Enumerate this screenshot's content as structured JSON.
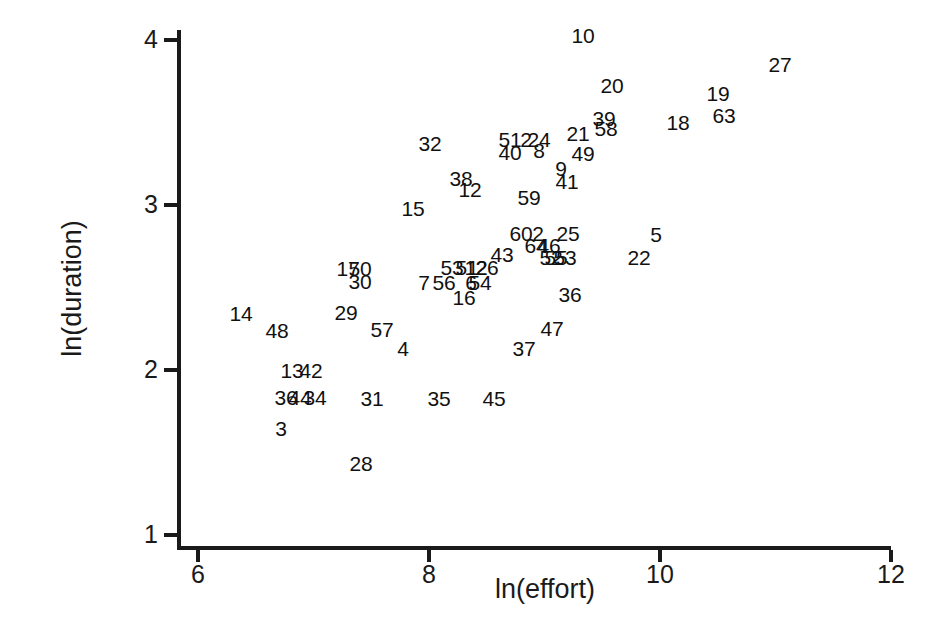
{
  "chart_data": {
    "type": "scatter",
    "title": "",
    "xlabel": "ln(effort)",
    "ylabel": "ln(duration)",
    "xlim": [
      6,
      12
    ],
    "ylim": [
      1,
      4
    ],
    "xticks": [
      6,
      8,
      10,
      12
    ],
    "yticks": [
      1,
      2,
      3,
      4
    ],
    "xtick_labels": [
      "6",
      "8",
      "10",
      "12"
    ],
    "ytick_labels": [
      "1",
      "2",
      "3",
      "4"
    ],
    "grid": false,
    "legend": null,
    "marker_style": "case-number-text",
    "points": [
      {
        "label": "10",
        "x": 9.34,
        "y": 3.98
      },
      {
        "label": "27",
        "x": 11.04,
        "y": 3.81
      },
      {
        "label": "20",
        "x": 9.59,
        "y": 3.68
      },
      {
        "label": "19",
        "x": 10.5,
        "y": 3.62
      },
      {
        "label": "18",
        "x": 10.15,
        "y": 3.44
      },
      {
        "label": "63",
        "x": 10.56,
        "y": 3.46
      },
      {
        "label": "39",
        "x": 9.48,
        "y": 3.49
      },
      {
        "label": "58",
        "x": 9.5,
        "y": 3.43
      },
      {
        "label": "21",
        "x": 9.26,
        "y": 3.4
      },
      {
        "label": "51",
        "x": 8.33,
        "y": 3.37
      },
      {
        "label": "2",
        "x": 8.47,
        "y": 3.37
      },
      {
        "label": "24",
        "x": 8.58,
        "y": 3.37
      },
      {
        "label": "40",
        "x": 8.33,
        "y": 3.29
      },
      {
        "label": "8",
        "x": 8.58,
        "y": 3.3
      },
      {
        "label": "49",
        "x": 9.3,
        "y": 3.29
      },
      {
        "label": "32",
        "x": 8.0,
        "y": 3.36
      },
      {
        "label": "9",
        "x": 9.1,
        "y": 3.2
      },
      {
        "label": "41",
        "x": 9.15,
        "y": 3.12
      },
      {
        "label": "38",
        "x": 8.44,
        "y": 3.14
      },
      {
        "label": "12",
        "x": 8.51,
        "y": 3.08
      },
      {
        "label": "59",
        "x": 9.02,
        "y": 3.03
      },
      {
        "label": "15",
        "x": 8.02,
        "y": 2.96
      },
      {
        "label": "60",
        "x": 8.93,
        "y": 2.79
      },
      {
        "label": "2b",
        "x": 9.05,
        "y": 2.79
      },
      {
        "label": "25",
        "x": 9.3,
        "y": 2.79
      },
      {
        "label": "5",
        "x": 9.97,
        "y": 2.76
      },
      {
        "label": "64",
        "x": 9.05,
        "y": 2.72
      },
      {
        "label": "46",
        "x": 9.16,
        "y": 2.72
      },
      {
        "label": "43",
        "x": 8.72,
        "y": 2.72
      },
      {
        "label": "52",
        "x": 9.21,
        "y": 2.65
      },
      {
        "label": "55",
        "x": 9.24,
        "y": 2.65
      },
      {
        "label": "53",
        "x": 9.33,
        "y": 2.65
      },
      {
        "label": "22",
        "x": 9.83,
        "y": 2.63
      },
      {
        "label": "17",
        "x": 7.44,
        "y": 2.64
      },
      {
        "label": "50",
        "x": 7.57,
        "y": 2.64
      },
      {
        "label": "30",
        "x": 7.57,
        "y": 2.57
      },
      {
        "label": "53b",
        "x": 8.56,
        "y": 2.65
      },
      {
        "label": "51b",
        "x": 8.67,
        "y": 2.65
      },
      {
        "label": "12b",
        "x": 8.73,
        "y": 2.65
      },
      {
        "label": "26",
        "x": 8.81,
        "y": 2.65
      },
      {
        "label": "7",
        "x": 8.29,
        "y": 2.57
      },
      {
        "label": "56",
        "x": 8.46,
        "y": 2.57
      },
      {
        "label": "6",
        "x": 8.66,
        "y": 2.57
      },
      {
        "label": "54",
        "x": 8.74,
        "y": 2.57
      },
      {
        "label": "16",
        "x": 8.61,
        "y": 2.48
      },
      {
        "label": "36",
        "x": 9.4,
        "y": 2.51
      },
      {
        "label": "14",
        "x": 6.55,
        "y": 2.41
      },
      {
        "label": "29",
        "x": 7.45,
        "y": 2.42
      },
      {
        "label": "48",
        "x": 6.85,
        "y": 2.31
      },
      {
        "label": "57",
        "x": 7.75,
        "y": 2.32
      },
      {
        "label": "47",
        "x": 9.24,
        "y": 2.32
      },
      {
        "label": "37",
        "x": 8.99,
        "y": 2.2
      },
      {
        "label": "4",
        "x": 7.94,
        "y": 2.2
      },
      {
        "label": "13",
        "x": 6.98,
        "y": 2.06
      },
      {
        "label": "42",
        "x": 7.1,
        "y": 2.06
      },
      {
        "label": "36b",
        "x": 7.03,
        "y": 1.89
      },
      {
        "label": "44",
        "x": 7.11,
        "y": 1.89
      },
      {
        "label": "34",
        "x": 7.19,
        "y": 1.89
      },
      {
        "label": "31",
        "x": 7.67,
        "y": 1.89
      },
      {
        "label": "35",
        "x": 8.25,
        "y": 1.89
      },
      {
        "label": "45",
        "x": 8.73,
        "y": 1.89
      },
      {
        "label": "3",
        "x": 6.9,
        "y": 1.71
      },
      {
        "label": "28",
        "x": 7.58,
        "y": 1.5
      }
    ]
  },
  "axes": {
    "y_title": "ln(duration)",
    "x_title": "ln(effort)",
    "y_ticks": [
      {
        "value": 4,
        "label": "4",
        "px": 38
      },
      {
        "value": 3,
        "label": "3",
        "px": 203
      },
      {
        "value": 2,
        "label": "2",
        "px": 368
      },
      {
        "value": 1,
        "label": "1",
        "px": 533
      }
    ],
    "x_ticks": [
      {
        "value": 6,
        "label": "6",
        "px": 197
      },
      {
        "value": 8,
        "label": "8",
        "px": 428
      },
      {
        "value": 10,
        "label": "10",
        "px": 659
      },
      {
        "value": 12,
        "label": "12",
        "px": 890
      }
    ]
  },
  "labels": [
    {
      "text": "10",
      "left": 583,
      "top": 35
    },
    {
      "text": "27",
      "left": 780,
      "top": 64
    },
    {
      "text": "20",
      "left": 612,
      "top": 85
    },
    {
      "text": "19",
      "left": 718,
      "top": 93
    },
    {
      "text": "63",
      "left": 724,
      "top": 115
    },
    {
      "text": "18",
      "left": 678,
      "top": 122
    },
    {
      "text": "39",
      "left": 604,
      "top": 118
    },
    {
      "text": "58",
      "left": 606,
      "top": 128
    },
    {
      "text": "21",
      "left": 578,
      "top": 133
    },
    {
      "text": "51",
      "left": 510,
      "top": 139
    },
    {
      "text": "2",
      "left": 526,
      "top": 139
    },
    {
      "text": "24",
      "left": 539,
      "top": 139
    },
    {
      "text": "40",
      "left": 510,
      "top": 152
    },
    {
      "text": "8",
      "left": 539,
      "top": 150
    },
    {
      "text": "49",
      "left": 583,
      "top": 153
    },
    {
      "text": "32",
      "left": 430,
      "top": 143
    },
    {
      "text": "9",
      "left": 561,
      "top": 168
    },
    {
      "text": "41",
      "left": 567,
      "top": 181
    },
    {
      "text": "38",
      "left": 461,
      "top": 178
    },
    {
      "text": "12",
      "left": 470,
      "top": 189
    },
    {
      "text": "59",
      "left": 529,
      "top": 197
    },
    {
      "text": "15",
      "left": 413,
      "top": 208
    },
    {
      "text": "60",
      "left": 521,
      "top": 233
    },
    {
      "text": "2",
      "left": 538,
      "top": 233
    },
    {
      "text": "25",
      "left": 568,
      "top": 233
    },
    {
      "text": "5",
      "left": 656,
      "top": 234
    },
    {
      "text": "64",
      "left": 536,
      "top": 245
    },
    {
      "text": "46",
      "left": 549,
      "top": 245
    },
    {
      "text": "43",
      "left": 502,
      "top": 254
    },
    {
      "text": "52",
      "left": 551,
      "top": 257
    },
    {
      "text": "55",
      "left": 556,
      "top": 257
    },
    {
      "text": "53",
      "left": 565,
      "top": 257
    },
    {
      "text": "22",
      "left": 639,
      "top": 257
    },
    {
      "text": "17",
      "left": 348,
      "top": 268
    },
    {
      "text": "50",
      "left": 360,
      "top": 268
    },
    {
      "text": "30",
      "left": 360,
      "top": 281
    },
    {
      "text": "53",
      "left": 452,
      "top": 267
    },
    {
      "text": "51",
      "left": 467,
      "top": 267
    },
    {
      "text": "12",
      "left": 476,
      "top": 267
    },
    {
      "text": "26",
      "left": 487,
      "top": 267
    },
    {
      "text": "7",
      "left": 424,
      "top": 282
    },
    {
      "text": "56",
      "left": 444,
      "top": 282
    },
    {
      "text": "6",
      "left": 471,
      "top": 282
    },
    {
      "text": "54",
      "left": 480,
      "top": 282
    },
    {
      "text": "16",
      "left": 464,
      "top": 297
    },
    {
      "text": "36",
      "left": 570,
      "top": 294
    },
    {
      "text": "14",
      "left": 241,
      "top": 313
    },
    {
      "text": "29",
      "left": 346,
      "top": 312
    },
    {
      "text": "48",
      "left": 277,
      "top": 330
    },
    {
      "text": "57",
      "left": 382,
      "top": 329
    },
    {
      "text": "47",
      "left": 552,
      "top": 328
    },
    {
      "text": "37",
      "left": 524,
      "top": 348
    },
    {
      "text": "4",
      "left": 403,
      "top": 348
    },
    {
      "text": "13",
      "left": 292,
      "top": 370
    },
    {
      "text": "42",
      "left": 311,
      "top": 370
    },
    {
      "text": "36",
      "left": 286,
      "top": 397
    },
    {
      "text": "44",
      "left": 300,
      "top": 397
    },
    {
      "text": "34",
      "left": 315,
      "top": 397
    },
    {
      "text": "31",
      "left": 372,
      "top": 398
    },
    {
      "text": "35",
      "left": 439,
      "top": 398
    },
    {
      "text": "45",
      "left": 494,
      "top": 398
    },
    {
      "text": "3",
      "left": 281,
      "top": 428
    },
    {
      "text": "28",
      "left": 361,
      "top": 463
    }
  ]
}
